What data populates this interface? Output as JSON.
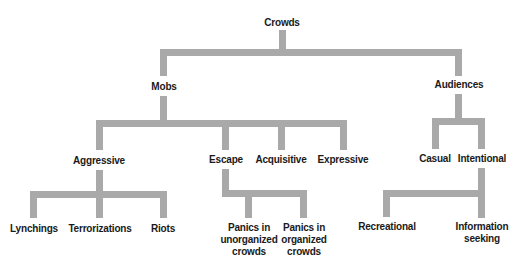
{
  "diagram": {
    "type": "hierarchy-tree",
    "connector_color": "#a9a9a9",
    "text_color": "#1a1a1a",
    "root": {
      "label": "Crowds",
      "children": [
        {
          "label": "Mobs",
          "children": [
            {
              "label": "Aggressive",
              "children": [
                {
                  "label": "Lynchings"
                },
                {
                  "label": "Terrorizations"
                },
                {
                  "label": "Riots"
                }
              ]
            },
            {
              "label": "Escape",
              "children": [
                {
                  "label": "Panics in unorganized crowds"
                },
                {
                  "label": "Panics in organized crowds"
                }
              ]
            },
            {
              "label": "Acquisitive"
            },
            {
              "label": "Expressive"
            }
          ]
        },
        {
          "label": "Audiences",
          "children": [
            {
              "label": "Casual"
            },
            {
              "label": "Intentional",
              "children": [
                {
                  "label": "Recreational"
                },
                {
                  "label": "Information seeking"
                }
              ]
            }
          ]
        }
      ]
    }
  },
  "nodes": {
    "crowds": "Crowds",
    "mobs": "Mobs",
    "audiences": "Audiences",
    "aggressive": "Aggressive",
    "escape": "Escape",
    "acquisitive": "Acquisitive",
    "expressive": "Expressive",
    "casual": "Casual",
    "intentional": "Intentional",
    "lynchings": "Lynchings",
    "terrorizations": "Terrorizations",
    "riots": "Riots",
    "panics_unorganized": [
      "Panics in",
      "unorganized",
      "crowds"
    ],
    "panics_organized": [
      "Panics in",
      "organized",
      "crowds"
    ],
    "recreational": "Recreational",
    "information_seeking": [
      "Information",
      "seeking"
    ]
  }
}
